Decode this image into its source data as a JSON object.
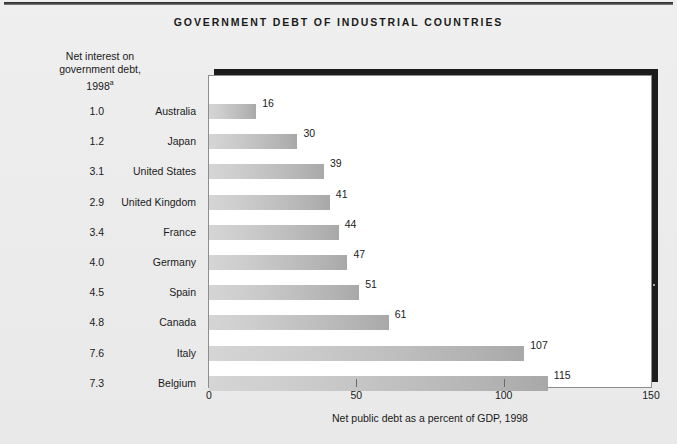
{
  "page": {
    "title": "GOVERNMENT DEBT OF INDUSTRIAL COUNTRIES",
    "left_header_line1": "Net interest on",
    "left_header_line2": "government debt,",
    "left_header_line3": "1998",
    "left_header_superscript": "a"
  },
  "chart_data": {
    "type": "bar",
    "orientation": "horizontal",
    "title": "GOVERNMENT DEBT OF INDUSTRIAL COUNTRIES",
    "xlabel": "Net public debt as a percent of GDP, 1998",
    "ylabel": "",
    "xlim": [
      0,
      150
    ],
    "xticks": [
      0,
      50,
      100,
      150
    ],
    "xtick_labels": [
      "0",
      "50",
      "100",
      "150"
    ],
    "grid": false,
    "legend": false,
    "categories": [
      "Australia",
      "Japan",
      "United States",
      "United Kingdom",
      "France",
      "Germany",
      "Spain",
      "Canada",
      "Italy",
      "Belgium"
    ],
    "values": [
      16,
      30,
      39,
      41,
      44,
      47,
      51,
      61,
      107,
      115
    ],
    "value_labels": [
      "16",
      "30",
      "39",
      "41",
      "44",
      "51",
      "47",
      "61",
      "107",
      "115"
    ],
    "series": [
      {
        "name": "Net public debt as a percent of GDP, 1998",
        "values": [
          16,
          30,
          39,
          41,
          44,
          47,
          51,
          61,
          107,
          115
        ]
      },
      {
        "name": "Net interest on government debt, 1998",
        "values": [
          1.0,
          1.2,
          3.1,
          2.9,
          3.4,
          4.0,
          4.5,
          4.8,
          7.6,
          7.3
        ]
      }
    ],
    "bar_color": "#bdbdbd",
    "rows": [
      {
        "interest": "1.0",
        "country": "Australia",
        "value": 16,
        "label": "16"
      },
      {
        "interest": "1.2",
        "country": "Japan",
        "value": 30,
        "label": "30"
      },
      {
        "interest": "3.1",
        "country": "United States",
        "value": 39,
        "label": "39"
      },
      {
        "interest": "2.9",
        "country": "United Kingdom",
        "value": 41,
        "label": "41"
      },
      {
        "interest": "3.4",
        "country": "France",
        "value": 44,
        "label": "44"
      },
      {
        "interest": "4.0",
        "country": "Germany",
        "value": 47,
        "label": "47"
      },
      {
        "interest": "4.5",
        "country": "Spain",
        "value": 51,
        "label": "51"
      },
      {
        "interest": "4.8",
        "country": "Canada",
        "value": 61,
        "label": "61"
      },
      {
        "interest": "7.6",
        "country": "Italy",
        "value": 107,
        "label": "107"
      },
      {
        "interest": "7.3",
        "country": "Belgium",
        "value": 115,
        "label": "115"
      }
    ]
  }
}
